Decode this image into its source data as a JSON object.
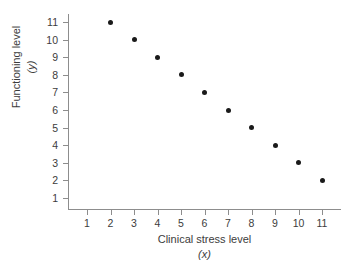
{
  "chart_data": {
    "type": "scatter",
    "title": "",
    "xlabel": "Clinical stress level",
    "xlabel_var": "(x)",
    "ylabel": "Functioning level",
    "ylabel_var": "(y)",
    "x": [
      2,
      3,
      4,
      5,
      6,
      7,
      8,
      9,
      10,
      11
    ],
    "y": [
      11,
      10,
      9,
      8,
      7,
      6,
      5,
      4,
      3,
      2
    ],
    "points": [
      {
        "x": 2,
        "y": 11
      },
      {
        "x": 3,
        "y": 10
      },
      {
        "x": 4,
        "y": 9
      },
      {
        "x": 5,
        "y": 8
      },
      {
        "x": 6,
        "y": 7
      },
      {
        "x": 7,
        "y": 6
      },
      {
        "x": 8,
        "y": 5
      },
      {
        "x": 9,
        "y": 4
      },
      {
        "x": 10,
        "y": 3
      },
      {
        "x": 11,
        "y": 2
      }
    ],
    "xticks": [
      1,
      2,
      3,
      4,
      5,
      6,
      7,
      8,
      9,
      10,
      11
    ],
    "yticks": [
      1,
      2,
      3,
      4,
      5,
      6,
      7,
      8,
      9,
      10,
      11
    ],
    "xlim": [
      0.6,
      11.6
    ],
    "ylim": [
      0.4,
      11.6
    ],
    "grid": false,
    "legend": false,
    "marker_color": "#1a1a1a",
    "axis_color": "#8d8d8d",
    "background": "#ffffff"
  }
}
